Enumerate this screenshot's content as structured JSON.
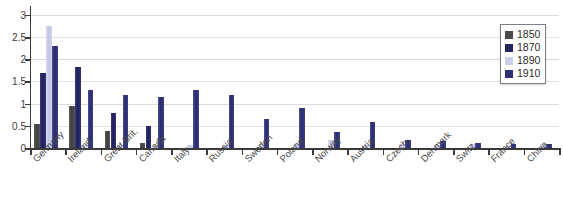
{
  "chart_data": {
    "type": "bar",
    "title": "",
    "xlabel": "",
    "ylabel": "",
    "ylim": [
      0,
      3.2
    ],
    "yticks": [
      0,
      0.5,
      1,
      1.5,
      2,
      2.5,
      3
    ],
    "ytick_labels": [
      "0",
      "0.5",
      "1",
      "1.5",
      "2",
      "2.5",
      "3"
    ],
    "grid": true,
    "legend_position": "top-right",
    "categories": [
      "Germany",
      "Ireland",
      "Great Brit.",
      "Canada",
      "Italy",
      "Russia",
      "Sweden",
      "Poland",
      "Norway",
      "Austria",
      "Czech.",
      "Denmark",
      "Switz.",
      "France",
      "China"
    ],
    "series": [
      {
        "name": "1850",
        "color": "#4a4a4a",
        "values": [
          0.55,
          0.95,
          0.38,
          0.12,
          0,
          0,
          0,
          0,
          0,
          0,
          0,
          0,
          0,
          0,
          0
        ]
      },
      {
        "name": "1870",
        "color": "#25255f",
        "values": [
          1.7,
          1.82,
          0.78,
          0.5,
          0,
          0,
          0,
          0,
          0,
          0,
          0,
          0,
          0,
          0,
          0
        ]
      },
      {
        "name": "1890",
        "color": "#cbcee6",
        "values": [
          2.75,
          0.06,
          0.06,
          0.06,
          0.06,
          0.06,
          0.08,
          0.1,
          0.18,
          0.06,
          0.1,
          0.06,
          0.1,
          0.05,
          0.1
        ]
      },
      {
        "name": "1910",
        "color": "#2f2f73",
        "values": [
          2.3,
          1.3,
          1.2,
          1.15,
          1.3,
          1.2,
          0.65,
          0.9,
          0.35,
          0.58,
          0.18,
          0.15,
          0.12,
          0.1,
          0.08
        ]
      }
    ]
  },
  "legend": {
    "items": [
      {
        "label": "1850",
        "color": "#4a4a4a"
      },
      {
        "label": "1870",
        "color": "#25255f"
      },
      {
        "label": "1890",
        "color": "#cbcee6"
      },
      {
        "label": "1910",
        "color": "#2f2f73"
      }
    ]
  }
}
